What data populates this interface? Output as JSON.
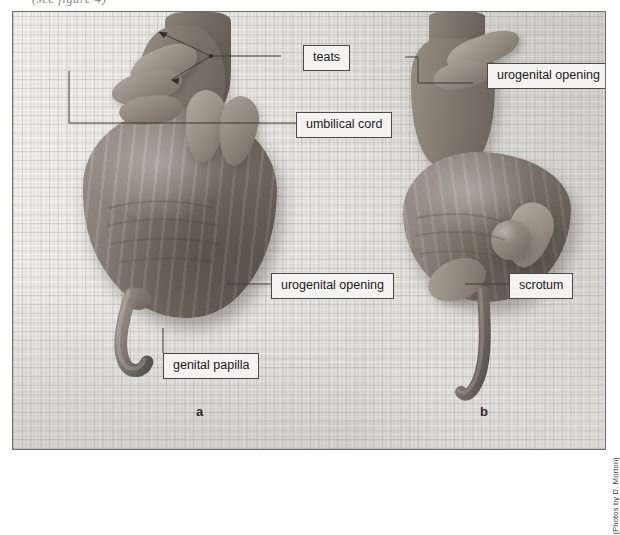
{
  "figure": {
    "cut_off_caption": "(see figure 4)",
    "credit": "(Photos by D. Morton)",
    "panels": [
      {
        "id": "a",
        "letter": "a",
        "sex": "female"
      },
      {
        "id": "b",
        "letter": "b",
        "sex": "male"
      }
    ],
    "annotations": [
      {
        "id": "teats",
        "label": "teats",
        "panel": "a"
      },
      {
        "id": "umbilical-cord",
        "label": "umbilical cord",
        "panel": "a"
      },
      {
        "id": "urogenital-opening-a",
        "label": "urogenital opening",
        "panel": "a"
      },
      {
        "id": "genital-papilla",
        "label": "genital papilla",
        "panel": "a"
      },
      {
        "id": "urogenital-opening-b",
        "label": "urogenital opening",
        "panel": "b"
      },
      {
        "id": "scrotum",
        "label": "scrotum",
        "panel": "b"
      }
    ],
    "colors": {
      "label_fill": "#f4f3f1",
      "label_border": "#4a4a4a",
      "leader_line": "#3a3a3a",
      "plate_border": "#6f6f6f",
      "towel_light": "#f2f1ee",
      "towel_mid": "#e3e1dc",
      "specimen_light": "#b5aca1",
      "specimen_dark": "#5c554d"
    }
  }
}
